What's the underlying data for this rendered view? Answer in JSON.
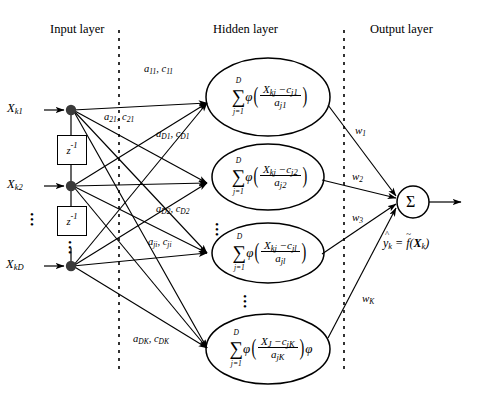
{
  "figure": {
    "type": "neural-network-diagram"
  },
  "layer_titles": {
    "input": "Input layer",
    "hidden": "Hidden layer",
    "output": "Output layer"
  },
  "input_layer": {
    "nodes": [
      {
        "id": "x-k1",
        "label_base": "X",
        "label_sub": "k1"
      },
      {
        "id": "x-k2",
        "label_base": "X",
        "label_sub": "k2"
      },
      {
        "id": "x-kD",
        "label_base": "X",
        "label_sub": "kD"
      }
    ],
    "delay_elements": [
      {
        "id": "delay-1",
        "base": "z",
        "exponent": "-1"
      },
      {
        "id": "delay-2",
        "base": "z",
        "exponent": "-1"
      }
    ],
    "ellipsis": "⋮"
  },
  "connection_labels": [
    {
      "id": "a11-c11",
      "text": "a",
      "sub1": "11",
      "text2": "c",
      "sub2": "11"
    },
    {
      "id": "a21-c21",
      "text": "a",
      "sub1": "21",
      "text2": "c",
      "sub2": "21"
    },
    {
      "id": "aD1-cD1",
      "text": "a",
      "sub1": "D1",
      "text2": "c",
      "sub2": "D1"
    },
    {
      "id": "aD2-cD2",
      "text": "a",
      "sub1": "D2",
      "text2": "c",
      "sub2": "D2"
    },
    {
      "id": "aji-cji",
      "text": "a",
      "sub1": "ji",
      "text2": "c",
      "sub2": "ji"
    },
    {
      "id": "aDK-cDK",
      "text": "a",
      "sub1": "DK",
      "text2": "c",
      "sub2": "DK"
    }
  ],
  "hidden_layer": {
    "ellipsis": "⋮",
    "nodes": [
      {
        "id": "hidden-node-1",
        "sum_symbol": "∑",
        "sum_upper": "D",
        "sum_lower": "j=1",
        "phi": "φ",
        "numerator": "X",
        "numerator_sub": "kj",
        "minus": "−",
        "center": "c",
        "center_sub": "j1",
        "denominator": "a",
        "denominator_sub": "j1",
        "trailing_phi": ""
      },
      {
        "id": "hidden-node-2",
        "sum_symbol": "∑",
        "sum_upper": "D",
        "sum_lower": "j=1",
        "phi": "φ",
        "numerator": "X",
        "numerator_sub": "kj",
        "minus": "−",
        "center": "c",
        "center_sub": "j2",
        "denominator": "a",
        "denominator_sub": "j2",
        "trailing_phi": ""
      },
      {
        "id": "hidden-node-l",
        "sum_symbol": "∑",
        "sum_upper": "D",
        "sum_lower": "j=1",
        "phi": "φ",
        "numerator": "X",
        "numerator_sub": "kj",
        "minus": "−",
        "center": "c",
        "center_sub": "jl",
        "denominator": "a",
        "denominator_sub": "jl",
        "trailing_phi": ""
      },
      {
        "id": "hidden-node-K",
        "sum_symbol": "∑",
        "sum_upper": "D",
        "sum_lower": "j=1",
        "phi": "φ",
        "numerator": "X",
        "numerator_sub": "J",
        "minus": "−",
        "center": "c",
        "center_sub": "jK",
        "denominator": "a",
        "denominator_sub": "jK",
        "trailing_phi": "φ"
      }
    ]
  },
  "output_layer": {
    "weights": [
      {
        "id": "w1",
        "symbol": "w",
        "sub": "1"
      },
      {
        "id": "w2",
        "symbol": "w",
        "sub": "2"
      },
      {
        "id": "w3",
        "symbol": "w",
        "sub": "3"
      },
      {
        "id": "wK",
        "symbol": "w",
        "sub": "K"
      }
    ],
    "sum_node": "Σ",
    "output_equation": "ŷₖ = ƒ̃(Xₖ)",
    "output_equation_parts": {
      "lhs": "ŷ",
      "lhs_sub": "k",
      "equals": "=",
      "func": "f",
      "arg_open": "(",
      "arg": "X",
      "arg_sub": "k",
      "arg_close": ")"
    }
  },
  "colors": {
    "stroke": "#000000",
    "background": "#ffffff",
    "node_fill": "#3a3a3a"
  }
}
